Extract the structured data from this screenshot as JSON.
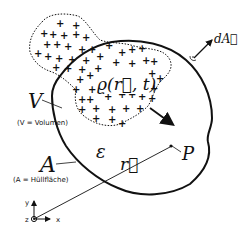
{
  "diagram": {
    "labels": {
      "volume": "V",
      "volume_caption": "(V = Volumen)",
      "surface": "A",
      "surface_caption": "(A = Hüllfläche)",
      "permittivity": "ε",
      "charge_density": "ϱ(r⃗, t)",
      "position_vector": "r⃗",
      "point": "P",
      "area_element": "dA⃗",
      "axis_x": "x",
      "axis_y": "y",
      "axis_z": "z"
    },
    "colors": {
      "stroke": "#111111",
      "background": "#ffffff"
    }
  }
}
